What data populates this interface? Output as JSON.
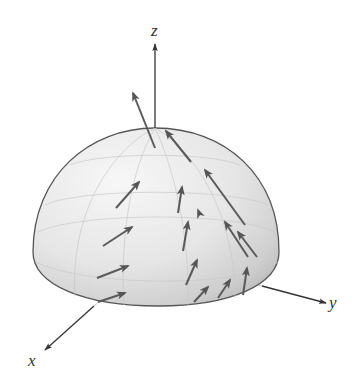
{
  "figure": {
    "axes": {
      "x_label": "x",
      "y_label": "y",
      "z_label": "z"
    },
    "colors": {
      "surface_light": "#f4f4f4",
      "surface_dark": "#bdbdbd",
      "outline": "#555555",
      "axis": "#3a3a3a",
      "vector": "#5a5a5a",
      "grid": "#c8c8c8"
    },
    "vector_count": 16
  }
}
